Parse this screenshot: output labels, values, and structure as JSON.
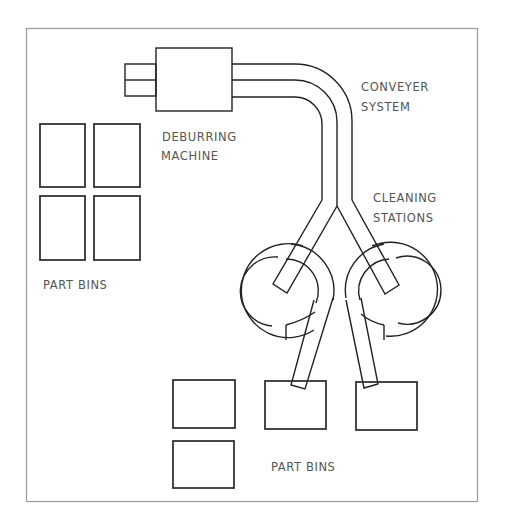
{
  "diagram": {
    "title": "",
    "labels": {
      "conveyer_line1": "CONVEYER",
      "conveyer_line2": "SYSTEM",
      "deburring_line1": "DEBURRING",
      "deburring_line2": "MACHINE",
      "cleaning_line1": "CLEANING",
      "cleaning_line2": "STATIONS",
      "part_bins_left": "PART BINS",
      "part_bins_bottom": "PART BINS"
    },
    "components": [
      {
        "name": "deburring-machine",
        "count": 1
      },
      {
        "name": "conveyer-system",
        "count": 1
      },
      {
        "name": "cleaning-station",
        "count": 2
      },
      {
        "name": "part-bin-left-group",
        "count": 4
      },
      {
        "name": "part-bin-bottom-group",
        "count": 4
      }
    ],
    "colors": {
      "line": "#222222",
      "frame": "#9a9a9a",
      "text": "#555555",
      "background": "#ffffff"
    }
  }
}
